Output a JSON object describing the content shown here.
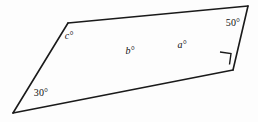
{
  "figure": {
    "type": "geometry-diagram",
    "background_color": "#fdfdfd",
    "line_color": "#1a1a1a",
    "labels": [
      {
        "id": "angle-30",
        "text": "30°",
        "x": 41,
        "y": 93,
        "style": "numeric"
      },
      {
        "id": "angle-c",
        "text": "c°",
        "x": 69,
        "y": 36,
        "style": "variable"
      },
      {
        "id": "angle-b",
        "text": "b°",
        "x": 130,
        "y": 51,
        "style": "variable"
      },
      {
        "id": "angle-a",
        "text": "a°",
        "x": 182,
        "y": 45,
        "style": "variable"
      },
      {
        "id": "angle-50",
        "text": "50°",
        "x": 233,
        "y": 23,
        "style": "numeric"
      }
    ],
    "vertices": {
      "left_apex": [
        13,
        113
      ],
      "top_left": [
        68,
        23
      ],
      "crossing": [
        157,
        50
      ],
      "top_right": [
        248,
        6
      ],
      "bottom_right": [
        233,
        70
      ]
    },
    "right_angle_marker": {
      "at": "bottom_right",
      "points": "221,53 232,54 231,65"
    },
    "segments": [
      {
        "name": "left-apex-to-top-left",
        "from": [
          13,
          113
        ],
        "to": [
          68,
          23
        ]
      },
      {
        "name": "top-left-to-crossing",
        "from": [
          68,
          23
        ],
        "to": [
          157,
          50
        ]
      },
      {
        "name": "crossing-to-left-apex",
        "from": [
          157,
          50
        ],
        "to": [
          13,
          113
        ]
      },
      {
        "name": "crossing-to-top-right",
        "from": [
          157,
          50
        ],
        "to": [
          248,
          6
        ]
      },
      {
        "name": "top-right-to-bottom-right",
        "from": [
          248,
          6
        ],
        "to": [
          233,
          70
        ]
      },
      {
        "name": "bottom-right-to-crossing",
        "from": [
          233,
          70
        ],
        "to": [
          157,
          50
        ]
      },
      {
        "name": "lower-line-extension",
        "from": [
          13,
          113
        ],
        "to": [
          233,
          70
        ]
      },
      {
        "name": "upper-line-extension",
        "from": [
          68,
          23
        ],
        "to": [
          248,
          6
        ]
      }
    ]
  }
}
